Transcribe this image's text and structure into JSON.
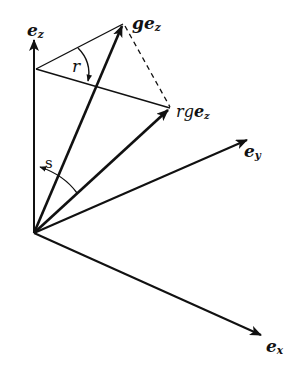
{
  "diagram": {
    "type": "vector-diagram",
    "colors": {
      "stroke": "#111111",
      "background": "#ffffff"
    },
    "labels": {
      "ez": {
        "base": "e",
        "sub": "z"
      },
      "ey": {
        "base": "e",
        "sub": "y"
      },
      "ex": {
        "base": "e",
        "sub": "x"
      },
      "gez": {
        "prefix": "g",
        "base": "e",
        "sub": "z"
      },
      "rgez": {
        "prefix": "rg",
        "base": "e",
        "sub": "z"
      }
    },
    "angles": {
      "r": "r",
      "s": "s"
    },
    "points": {
      "origin": [
        34,
        233
      ],
      "ez_tip": [
        34,
        38
      ],
      "apex": [
        36,
        69
      ],
      "gez_tip": [
        123,
        24
      ],
      "rgez_tip": [
        170,
        108
      ],
      "ey_tip": [
        248,
        139
      ],
      "ex_tip": [
        262,
        336
      ]
    }
  }
}
